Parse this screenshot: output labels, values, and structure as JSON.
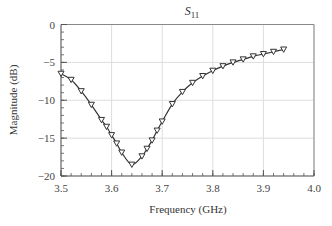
{
  "chart_data": {
    "type": "line",
    "title": "S11",
    "title_main": "S",
    "title_sub": "11",
    "xlabel": "Frequency (GHz)",
    "ylabel": "Magnitude (dB)",
    "xlim": [
      3.5,
      4.0
    ],
    "ylim": [
      -20,
      0
    ],
    "xticks": [
      "3.5",
      "3.6",
      "3.7",
      "3.8",
      "3.9",
      "4.0"
    ],
    "yticks": [
      "0",
      "-5",
      "-10",
      "-15",
      "-20"
    ],
    "grid": true,
    "legend": null,
    "marker": "down-triangle",
    "series": [
      {
        "name": "S11",
        "x": [
          3.5,
          3.52,
          3.54,
          3.56,
          3.58,
          3.59,
          3.6,
          3.61,
          3.62,
          3.64,
          3.66,
          3.67,
          3.68,
          3.69,
          3.7,
          3.72,
          3.74,
          3.76,
          3.78,
          3.8,
          3.82,
          3.84,
          3.86,
          3.88,
          3.9,
          3.92,
          3.94
        ],
        "values": [
          -6.5,
          -7.3,
          -8.8,
          -10.6,
          -12.6,
          -13.5,
          -14.6,
          -15.7,
          -16.9,
          -18.5,
          -17.4,
          -16.4,
          -15.3,
          -14.0,
          -12.8,
          -10.5,
          -8.9,
          -7.7,
          -6.8,
          -6.1,
          -5.5,
          -5.0,
          -4.6,
          -4.2,
          -3.9,
          -3.6,
          -3.3
        ]
      }
    ]
  },
  "colors": {
    "line": "#333333",
    "grid": "#dddddd",
    "axis": "#555555"
  }
}
